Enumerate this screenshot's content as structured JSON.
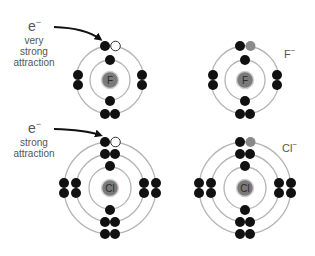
{
  "diagram": {
    "panels": [
      {
        "id": "F-atom",
        "symbol": "F",
        "arrow_label_e": "e",
        "arrow_label_e_sup": "−",
        "attraction_line1": "very",
        "attraction_line2": "strong",
        "attraction_line3": "attraction"
      },
      {
        "id": "F-ion",
        "symbol": "F",
        "ion_label": "F",
        "ion_label_sup": "−"
      },
      {
        "id": "Cl-atom",
        "symbol": "Cl",
        "arrow_label_e": "e",
        "arrow_label_e_sup": "−",
        "attraction_line1": "strong",
        "attraction_line2": "attraction"
      },
      {
        "id": "Cl-ion",
        "symbol": "Cl",
        "ion_label": "Cl",
        "ion_label_sup": "−"
      }
    ],
    "colors": {
      "electron": "#111111",
      "vacancy": "#ffffff",
      "added_electron": "#8a8a8a",
      "nucleus": "#7a7a7a",
      "ring": "#b5b5b5",
      "text": "#555555"
    }
  }
}
